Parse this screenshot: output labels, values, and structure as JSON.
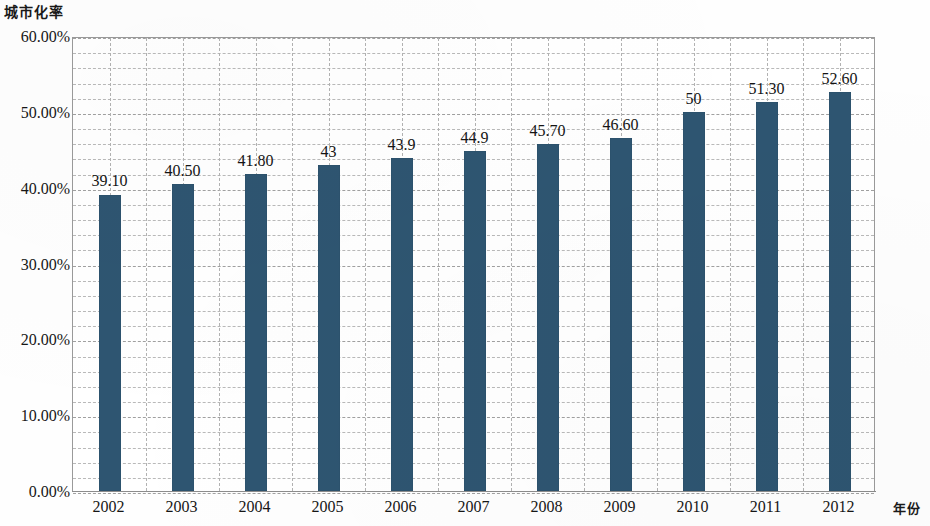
{
  "chart_data": {
    "type": "bar",
    "title": "",
    "ylabel": "城市化率",
    "xlabel": "年份",
    "categories": [
      "2002",
      "2003",
      "2004",
      "2005",
      "2006",
      "2007",
      "2008",
      "2009",
      "2010",
      "2011",
      "2012"
    ],
    "values": [
      39.1,
      40.5,
      41.8,
      43,
      43.9,
      44.9,
      45.7,
      46.6,
      50,
      51.3,
      52.6
    ],
    "data_labels": [
      "39.10",
      "40.50",
      "41.80",
      "43",
      "43.9",
      "44.9",
      "45.70",
      "46.60",
      "50",
      "51.30",
      "52.60"
    ],
    "ylim": [
      0,
      60
    ],
    "y_tick_labels": [
      "60.00%",
      "50.00%",
      "40.00%",
      "30.00%",
      "20.00%",
      "10.00%",
      "0.00%"
    ],
    "y_tick_values": [
      60,
      50,
      40,
      30,
      20,
      10,
      0
    ],
    "y_major_step": 10,
    "y_minor_step": 2,
    "grid": true,
    "legend": "none",
    "series_color": "#2e5571",
    "gridline_color": "#b9b9b9",
    "axis_color": "#9a9a9a",
    "units": "percent"
  }
}
